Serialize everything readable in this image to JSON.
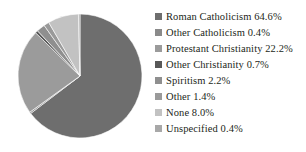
{
  "chart_data": {
    "type": "pie",
    "title": "",
    "subtitle": "",
    "xlabel": "",
    "ylabel": "",
    "legend_position": "right",
    "grid": false,
    "start_angle_deg": 0,
    "direction": "clockwise",
    "units": "percent",
    "categories": [
      "Roman Catholicism",
      "Other Catholicism",
      "Protestant Christianity",
      "Other Christianity",
      "Spiritism",
      "Other",
      "None",
      "Unspecified"
    ],
    "values": [
      64.6,
      0.4,
      22.2,
      0.7,
      2.2,
      1.4,
      8.0,
      0.4
    ],
    "colors": [
      "#6e6e6e",
      "#8a8a8a",
      "#9b9b9b",
      "#585858",
      "#8f8f8f",
      "#9a9a9a",
      "#c2c2c2",
      "#a8a8a8"
    ],
    "slices": [
      {
        "label": "Roman Catholicism",
        "value": 64.6,
        "display": "64.6%",
        "color": "#6e6e6e"
      },
      {
        "label": "Other Catholicism",
        "value": 0.4,
        "display": "0.4%",
        "color": "#8a8a8a"
      },
      {
        "label": "Protestant Christianity",
        "value": 22.2,
        "display": "22.2%",
        "color": "#9b9b9b"
      },
      {
        "label": "Other Christianity",
        "value": 0.7,
        "display": "0.7%",
        "color": "#585858"
      },
      {
        "label": "Spiritism",
        "value": 2.2,
        "display": "2.2%",
        "color": "#8f8f8f"
      },
      {
        "label": "Other",
        "value": 1.4,
        "display": "1.4%",
        "color": "#9a9a9a"
      },
      {
        "label": "None",
        "value": 8.0,
        "display": "8.0%",
        "color": "#c2c2c2"
      },
      {
        "label": "Unspecified",
        "value": 0.4,
        "display": "0.4%",
        "color": "#a8a8a8"
      }
    ]
  },
  "pie": {
    "center_x": 80,
    "center_y": 76,
    "radius": 62
  },
  "legend": {
    "items": [
      {
        "label": "Roman Catholicism 64.6%",
        "color": "#6e6e6e"
      },
      {
        "label": "Other Catholicism 0.4%",
        "color": "#8a8a8a"
      },
      {
        "label": "Protestant Christianity  22.2%",
        "color": "#9b9b9b"
      },
      {
        "label": "Other Christianity 0.7%",
        "color": "#585858"
      },
      {
        "label": "Spiritism 2.2%",
        "color": "#8f8f8f"
      },
      {
        "label": "Other 1.4%",
        "color": "#9a9a9a"
      },
      {
        "label": "None 8.0%",
        "color": "#c2c2c2"
      },
      {
        "label": "Unspecified 0.4%",
        "color": "#a8a8a8"
      }
    ]
  }
}
